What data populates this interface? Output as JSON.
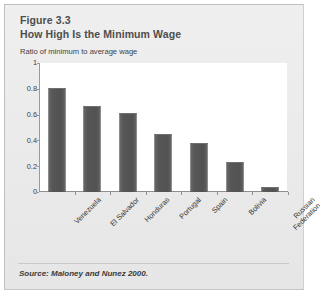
{
  "figure": {
    "label": "Figure 3.3",
    "title": "How High Is the Minimum Wage",
    "source_note": "Source: Maloney and Nunez 2000.",
    "card_background": "#ececec",
    "card_border": "#bfbfbf"
  },
  "chart_data": {
    "type": "bar",
    "title": "How High Is the Minimum Wage",
    "subtitle": "Figure 3.3",
    "ylabel": "Ratio of minimum to average wage",
    "xlabel": "",
    "ylim": [
      0,
      1
    ],
    "yticks": [
      "0",
      "0.2",
      "0.4",
      "0.6",
      "0.8",
      "1"
    ],
    "ytick_values": [
      0,
      0.2,
      0.4,
      0.6,
      0.8,
      1
    ],
    "grid": false,
    "legend": "none",
    "bar_color": "#575757",
    "plot_background": "#ffffff",
    "categories": [
      "Venezuela",
      "El Salvador",
      "Honduras",
      "Portugal",
      "Spain",
      "Bolivia",
      "Russian Federation"
    ],
    "category_lines": [
      [
        "Venezuela"
      ],
      [
        "El Salvador"
      ],
      [
        "Honduras"
      ],
      [
        "Portugal"
      ],
      [
        "Spain"
      ],
      [
        "Bolivia"
      ],
      [
        "Russian",
        "Federation"
      ]
    ],
    "values": [
      0.81,
      0.67,
      0.61,
      0.45,
      0.38,
      0.23,
      0.04
    ],
    "series": [
      {
        "name": "Ratio of minimum to average wage",
        "values": [
          0.81,
          0.67,
          0.61,
          0.45,
          0.38,
          0.23,
          0.04
        ]
      }
    ]
  }
}
